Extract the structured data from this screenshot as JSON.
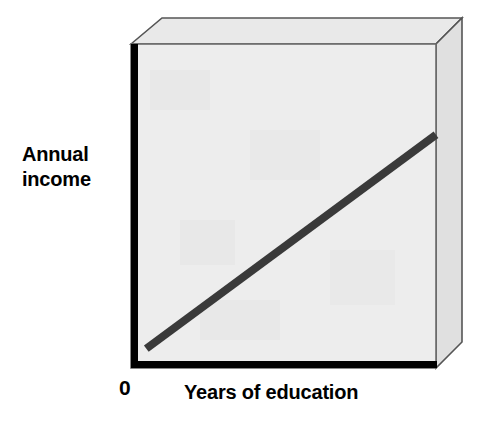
{
  "chart_data": {
    "type": "line",
    "title": "",
    "subtitle": "",
    "xlabel": "Years of education",
    "ylabel": "Annual income",
    "origin_label": "0",
    "legend": [],
    "annotations": [],
    "grid": false,
    "axis_style": "3d-box",
    "xlim": [
      0,
      1
    ],
    "ylim": [
      0,
      1
    ],
    "xticks": [],
    "yticks": [],
    "series": [
      {
        "name": "Positive linear relationship",
        "color": "#3a3a3a",
        "line_width": 8,
        "x": [
          0.05,
          1.0
        ],
        "y": [
          0.06,
          0.72
        ],
        "points": [
          {
            "x": 0.05,
            "y": 0.06
          },
          {
            "x": 1.0,
            "y": 0.72
          }
        ]
      }
    ]
  },
  "colors": {
    "background": "#ffffff",
    "plot_face": "#ededed",
    "box_top_face": "#e9e9e9",
    "box_side_face": "#e0e0e0",
    "axis": "#000000",
    "plot_border": "#6b6b6b",
    "box_edge": "#555555",
    "trend_line": "#3a3a3a",
    "text": "#000000"
  }
}
